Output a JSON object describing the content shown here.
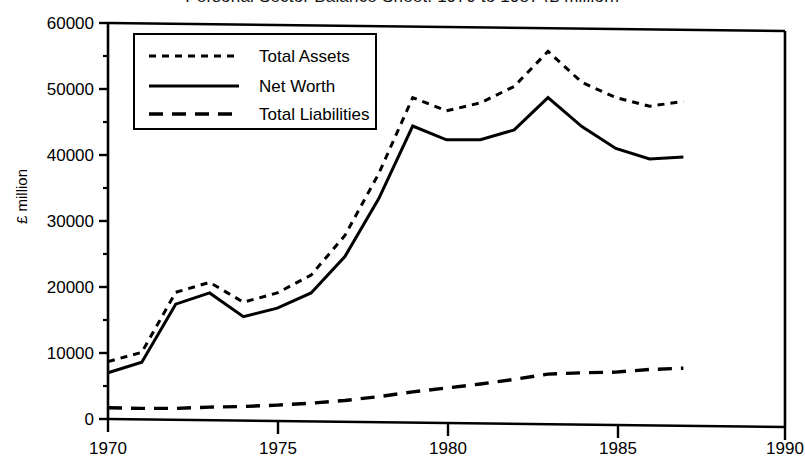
{
  "chart_data": {
    "type": "line",
    "title": "Personal Sector Balance Sheet, 1970 to 1987 (£ million)",
    "xlabel": "",
    "ylabel": "£ million",
    "xlim": [
      1970,
      1990
    ],
    "ylim": [
      0,
      60000
    ],
    "xticks": [
      "1970",
      "1975",
      "1980",
      "1985",
      "1990"
    ],
    "xtick_values": [
      1970,
      1975,
      1980,
      1985,
      1990
    ],
    "yticks": [
      "0",
      "10000",
      "20000",
      "30000",
      "40000",
      "50000",
      "60000"
    ],
    "ytick_values": [
      0,
      10000,
      20000,
      30000,
      40000,
      50000,
      60000
    ],
    "grid": false,
    "legend_position": "upper-left",
    "x": [
      1970,
      1971,
      1972,
      1973,
      1974,
      1975,
      1976,
      1977,
      1978,
      1979,
      1980,
      1981,
      1982,
      1983,
      1984,
      1985,
      1986,
      1987
    ],
    "series": [
      {
        "name": "Total Assets",
        "style": "dotted",
        "values": [
          8700,
          10100,
          19200,
          20700,
          17700,
          19100,
          21800,
          27800,
          37200,
          48700,
          46700,
          47900,
          50400,
          55700,
          51000,
          48700,
          47400,
          48100
        ]
      },
      {
        "name": "Net Worth",
        "style": "solid",
        "values": [
          7000,
          8600,
          17400,
          19100,
          15500,
          16800,
          19100,
          24600,
          33400,
          44400,
          42300,
          42300,
          43800,
          48700,
          44300,
          41000,
          39400,
          39700
        ]
      },
      {
        "name": "Total Liabilities",
        "style": "dashed",
        "values": [
          1700,
          1600,
          1600,
          1800,
          1900,
          2100,
          2400,
          2800,
          3400,
          4100,
          4700,
          5300,
          6000,
          6800,
          7000,
          7100,
          7500,
          7700
        ]
      }
    ]
  },
  "legend": {
    "items": [
      {
        "label": "Total Assets",
        "style": "dotted"
      },
      {
        "label": "Net Worth",
        "style": "solid"
      },
      {
        "label": "Total Liabilities",
        "style": "dashed"
      }
    ]
  },
  "colors": {
    "ink": "#000000",
    "background": "#ffffff"
  }
}
